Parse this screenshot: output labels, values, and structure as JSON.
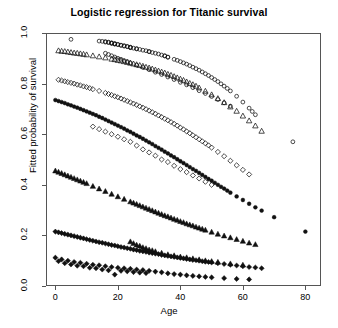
{
  "chart_data": {
    "type": "scatter",
    "title": "Logistic regression for Titanic survival",
    "xlabel": "Age",
    "ylabel": "Fitted probability of survival",
    "xlim": [
      -3,
      85
    ],
    "ylim": [
      0.0,
      1.0
    ],
    "grid": false,
    "legend": "none",
    "xticks": [
      0,
      20,
      40,
      60,
      80
    ],
    "xtick_labels": [
      "0",
      "20",
      "40",
      "60",
      "80"
    ],
    "yticks": [
      0.0,
      0.2,
      0.4,
      0.6,
      0.8,
      1.0
    ],
    "ytick_labels": [
      "0.0",
      "0.2",
      "0.4",
      "0.6",
      "0.8",
      "1.0"
    ],
    "marker_types": [
      "open-circle",
      "open-triangle",
      "open-diamond",
      "filled-circle",
      "filled-triangle",
      "filled-diamond"
    ],
    "point_color": "#111111",
    "series": [
      {
        "name": "open-circle",
        "marker": "open-circle",
        "x": [
          5,
          14,
          15,
          16,
          16,
          17,
          17,
          18,
          18,
          18,
          19,
          19,
          19,
          20,
          20,
          21,
          21,
          22,
          22,
          23,
          23,
          24,
          24,
          24,
          25,
          26,
          26,
          27,
          28,
          29,
          30,
          30,
          31,
          32,
          33,
          34,
          35,
          35,
          36,
          36,
          38,
          39,
          40,
          41,
          42,
          43,
          44,
          45,
          46,
          47,
          48,
          49,
          50,
          51,
          52,
          53,
          54,
          55,
          56,
          58,
          60,
          62,
          63,
          64,
          76
        ],
        "y": [
          0.975,
          0.968,
          0.967,
          0.966,
          0.964,
          0.964,
          0.962,
          0.961,
          0.96,
          0.959,
          0.958,
          0.957,
          0.956,
          0.955,
          0.954,
          0.952,
          0.951,
          0.95,
          0.948,
          0.947,
          0.946,
          0.944,
          0.943,
          0.942,
          0.94,
          0.938,
          0.937,
          0.935,
          0.932,
          0.93,
          0.927,
          0.926,
          0.923,
          0.92,
          0.917,
          0.913,
          0.91,
          0.909,
          0.905,
          0.904,
          0.896,
          0.892,
          0.887,
          0.882,
          0.877,
          0.871,
          0.865,
          0.859,
          0.853,
          0.846,
          0.839,
          0.832,
          0.824,
          0.816,
          0.808,
          0.799,
          0.79,
          0.781,
          0.771,
          0.75,
          0.727,
          0.703,
          0.69,
          0.677,
          0.57
        ]
      },
      {
        "name": "open-triangle",
        "marker": "open-triangle",
        "x": [
          1,
          2,
          3,
          4,
          5,
          6,
          7,
          8,
          9,
          10,
          12,
          14,
          16,
          18,
          19,
          20,
          21,
          22,
          23,
          24,
          25,
          26,
          27,
          28,
          29,
          30,
          31,
          32,
          33,
          34,
          35,
          36,
          37,
          38,
          39,
          40,
          41,
          42,
          43,
          44,
          45,
          46,
          48,
          50,
          52,
          54,
          56,
          58,
          60,
          62,
          64,
          66
        ],
        "y": [
          0.93,
          0.928,
          0.927,
          0.925,
          0.923,
          0.921,
          0.92,
          0.918,
          0.916,
          0.914,
          0.91,
          0.906,
          0.902,
          0.897,
          0.895,
          0.892,
          0.89,
          0.887,
          0.884,
          0.881,
          0.878,
          0.875,
          0.872,
          0.869,
          0.865,
          0.862,
          0.858,
          0.854,
          0.85,
          0.846,
          0.842,
          0.837,
          0.833,
          0.828,
          0.823,
          0.818,
          0.813,
          0.807,
          0.801,
          0.796,
          0.79,
          0.783,
          0.77,
          0.756,
          0.741,
          0.725,
          0.708,
          0.691,
          0.672,
          0.653,
          0.633,
          0.612
        ]
      },
      {
        "name": "open-diamond",
        "marker": "open-diamond",
        "x": [
          1,
          2,
          3,
          4,
          5,
          6,
          7,
          8,
          9,
          10,
          11,
          12,
          14,
          16,
          17,
          18,
          19,
          20,
          21,
          22,
          23,
          24,
          25,
          26,
          27,
          28,
          29,
          30,
          31,
          32,
          33,
          34,
          35,
          36,
          37,
          38,
          39,
          40,
          41,
          42,
          43,
          44,
          45,
          46,
          47,
          48,
          49,
          50,
          52,
          54,
          56,
          58,
          60,
          62
        ],
        "y": [
          0.815,
          0.812,
          0.809,
          0.806,
          0.803,
          0.8,
          0.796,
          0.793,
          0.789,
          0.786,
          0.782,
          0.778,
          0.771,
          0.763,
          0.759,
          0.755,
          0.75,
          0.746,
          0.741,
          0.736,
          0.731,
          0.726,
          0.721,
          0.716,
          0.71,
          0.705,
          0.699,
          0.693,
          0.687,
          0.681,
          0.674,
          0.668,
          0.661,
          0.655,
          0.648,
          0.641,
          0.634,
          0.626,
          0.619,
          0.611,
          0.604,
          0.596,
          0.588,
          0.58,
          0.572,
          0.564,
          0.556,
          0.547,
          0.53,
          0.513,
          0.495,
          0.477,
          0.459,
          0.441
        ]
      },
      {
        "name": "filled-circle",
        "marker": "filled-circle",
        "x": [
          0,
          1,
          2,
          3,
          4,
          5,
          6,
          7,
          8,
          9,
          10,
          11,
          12,
          13,
          14,
          15,
          16,
          17,
          18,
          19,
          20,
          21,
          22,
          23,
          24,
          25,
          26,
          27,
          28,
          29,
          30,
          31,
          32,
          33,
          34,
          35,
          36,
          37,
          38,
          39,
          40,
          41,
          42,
          43,
          44,
          45,
          46,
          47,
          48,
          49,
          50,
          51,
          52,
          53,
          54,
          55,
          56,
          58,
          60,
          62,
          64,
          66,
          70,
          80
        ],
        "y": [
          0.735,
          0.731,
          0.727,
          0.723,
          0.718,
          0.714,
          0.709,
          0.705,
          0.7,
          0.695,
          0.69,
          0.685,
          0.68,
          0.675,
          0.669,
          0.664,
          0.658,
          0.652,
          0.646,
          0.64,
          0.634,
          0.628,
          0.622,
          0.615,
          0.609,
          0.602,
          0.595,
          0.589,
          0.582,
          0.575,
          0.568,
          0.561,
          0.553,
          0.546,
          0.539,
          0.531,
          0.524,
          0.516,
          0.509,
          0.501,
          0.493,
          0.486,
          0.478,
          0.47,
          0.462,
          0.455,
          0.447,
          0.439,
          0.431,
          0.423,
          0.416,
          0.408,
          0.4,
          0.392,
          0.385,
          0.377,
          0.369,
          0.354,
          0.34,
          0.325,
          0.311,
          0.298,
          0.272,
          0.215
        ]
      },
      {
        "name": "filled-triangle",
        "marker": "filled-triangle",
        "x": [
          0,
          1,
          2,
          3,
          4,
          5,
          6,
          7,
          8,
          9,
          10,
          12,
          14,
          16,
          18,
          20,
          22,
          24,
          25,
          26,
          27,
          28,
          29,
          30,
          31,
          32,
          33,
          34,
          35,
          36,
          37,
          38,
          39,
          40,
          41,
          42,
          43,
          44,
          45,
          46,
          47,
          48,
          50,
          52,
          54,
          56,
          58,
          60,
          62,
          64
        ],
        "y": [
          0.455,
          0.45,
          0.445,
          0.44,
          0.435,
          0.43,
          0.425,
          0.42,
          0.415,
          0.41,
          0.405,
          0.394,
          0.384,
          0.374,
          0.363,
          0.353,
          0.343,
          0.333,
          0.328,
          0.323,
          0.318,
          0.313,
          0.308,
          0.303,
          0.298,
          0.293,
          0.288,
          0.283,
          0.278,
          0.274,
          0.269,
          0.264,
          0.26,
          0.255,
          0.251,
          0.246,
          0.242,
          0.238,
          0.233,
          0.229,
          0.225,
          0.221,
          0.213,
          0.205,
          0.198,
          0.191,
          0.184,
          0.177,
          0.17,
          0.164
        ]
      },
      {
        "name": "filled-diamond",
        "marker": "filled-diamond",
        "x": [
          0,
          1,
          2,
          3,
          4,
          5,
          6,
          7,
          8,
          9,
          10,
          11,
          12,
          13,
          14,
          15,
          16,
          17,
          18,
          19,
          20,
          21,
          22,
          23,
          24,
          25,
          26,
          27,
          28,
          29,
          30,
          31,
          32,
          33,
          34,
          35,
          36,
          37,
          38,
          39,
          40,
          41,
          42,
          43,
          44,
          45,
          46,
          47,
          48,
          49,
          50,
          52,
          54,
          56,
          58,
          60,
          62,
          64,
          66
        ],
        "y": [
          0.215,
          0.212,
          0.209,
          0.206,
          0.203,
          0.2,
          0.197,
          0.194,
          0.191,
          0.188,
          0.185,
          0.182,
          0.179,
          0.176,
          0.173,
          0.171,
          0.168,
          0.165,
          0.162,
          0.16,
          0.157,
          0.154,
          0.152,
          0.149,
          0.147,
          0.144,
          0.142,
          0.139,
          0.137,
          0.135,
          0.132,
          0.13,
          0.128,
          0.126,
          0.123,
          0.121,
          0.119,
          0.117,
          0.115,
          0.113,
          0.111,
          0.109,
          0.107,
          0.105,
          0.103,
          0.102,
          0.1,
          0.098,
          0.096,
          0.095,
          0.093,
          0.09,
          0.087,
          0.084,
          0.081,
          0.078,
          0.075,
          0.073,
          0.07
        ]
      },
      {
        "name": "filled-diamond-low-scatter",
        "marker": "filled-diamond",
        "x": [
          0,
          1,
          2,
          3,
          4,
          5,
          6,
          7,
          8,
          9,
          10,
          11,
          12,
          13,
          14,
          15,
          16,
          17,
          18,
          19,
          20,
          21,
          22,
          23,
          24,
          25,
          26,
          27,
          28,
          29,
          30,
          32,
          34,
          36,
          38,
          40,
          42,
          44,
          46,
          48,
          50,
          54,
          58,
          62
        ],
        "y": [
          0.112,
          0.098,
          0.105,
          0.09,
          0.1,
          0.085,
          0.095,
          0.08,
          0.092,
          0.078,
          0.088,
          0.072,
          0.084,
          0.07,
          0.082,
          0.065,
          0.078,
          0.062,
          0.075,
          0.045,
          0.072,
          0.06,
          0.07,
          0.058,
          0.068,
          0.055,
          0.065,
          0.053,
          0.063,
          0.051,
          0.06,
          0.057,
          0.054,
          0.05,
          0.047,
          0.045,
          0.042,
          0.04,
          0.038,
          0.036,
          0.034,
          0.031,
          0.028,
          0.026
        ]
      },
      {
        "name": "filled-triangle-low-scatter",
        "marker": "filled-triangle",
        "x": [
          24,
          25,
          26,
          27,
          28,
          29,
          30,
          31,
          32,
          34,
          36,
          38,
          40,
          42,
          44,
          46,
          48,
          50,
          52,
          56,
          60
        ],
        "y": [
          0.175,
          0.168,
          0.162,
          0.158,
          0.152,
          0.148,
          0.143,
          0.14,
          0.136,
          0.13,
          0.124,
          0.12,
          0.115,
          0.112,
          0.108,
          0.104,
          0.1,
          0.097,
          0.094,
          0.088,
          0.083
        ]
      },
      {
        "name": "open-circle-upper-scatter",
        "marker": "open-circle",
        "x": [
          16,
          17,
          18,
          19,
          20,
          21,
          22,
          23,
          24,
          26,
          28,
          30,
          32,
          34,
          36,
          38,
          40,
          42,
          44,
          46,
          48,
          50,
          52,
          54,
          56
        ],
        "y": [
          0.92,
          0.915,
          0.91,
          0.905,
          0.9,
          0.896,
          0.891,
          0.887,
          0.882,
          0.873,
          0.864,
          0.855,
          0.845,
          0.836,
          0.826,
          0.816,
          0.805,
          0.795,
          0.784,
          0.772,
          0.761,
          0.749,
          0.737,
          0.724,
          0.711
        ]
      },
      {
        "name": "open-diamond-mid-scatter",
        "marker": "open-diamond",
        "x": [
          12,
          14,
          16,
          18,
          20,
          22,
          24,
          26,
          28,
          30,
          32,
          34,
          36,
          38,
          40,
          42,
          44,
          46,
          48,
          50
        ],
        "y": [
          0.63,
          0.62,
          0.61,
          0.6,
          0.59,
          0.58,
          0.57,
          0.555,
          0.54,
          0.528,
          0.515,
          0.5,
          0.49,
          0.475,
          0.462,
          0.45,
          0.437,
          0.425,
          0.412,
          0.4
        ]
      }
    ]
  },
  "axes": {
    "x_title": "Age",
    "y_title": "Fitted probability of survival"
  }
}
